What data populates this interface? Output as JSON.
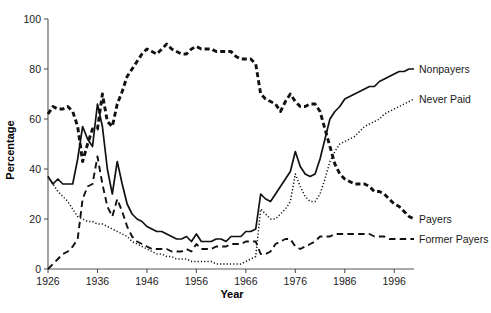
{
  "chart_data": {
    "type": "line",
    "title": "",
    "xlabel": "Year",
    "ylabel": "Percentage",
    "xlim": [
      1926,
      2000
    ],
    "ylim": [
      0,
      100
    ],
    "grid": false,
    "legend_position": "right-inline-labels",
    "xticks": [
      1926,
      1936,
      1946,
      1956,
      1966,
      1976,
      1986,
      1996
    ],
    "xtick_labels": [
      "1926",
      "1936",
      "1946",
      "1956",
      "1966",
      "1976",
      "1986",
      "1996"
    ],
    "yticks": [
      0,
      20,
      40,
      60,
      80,
      100
    ],
    "ytick_labels": [
      "0",
      "20",
      "40",
      "60",
      "80",
      "100"
    ],
    "x": [
      1926,
      1927,
      1928,
      1929,
      1930,
      1931,
      1932,
      1933,
      1934,
      1935,
      1936,
      1937,
      1938,
      1939,
      1940,
      1941,
      1942,
      1943,
      1944,
      1945,
      1946,
      1947,
      1948,
      1949,
      1950,
      1951,
      1952,
      1953,
      1954,
      1955,
      1956,
      1957,
      1958,
      1959,
      1960,
      1961,
      1962,
      1963,
      1964,
      1965,
      1966,
      1967,
      1968,
      1969,
      1970,
      1971,
      1972,
      1973,
      1974,
      1975,
      1976,
      1977,
      1978,
      1979,
      1980,
      1981,
      1982,
      1983,
      1984,
      1985,
      1986,
      1987,
      1988,
      1989,
      1990,
      1991,
      1992,
      1993,
      1994,
      1995,
      1996,
      1997,
      1998,
      1999,
      2000
    ],
    "series": [
      {
        "name": "Nonpayers",
        "style": "solid",
        "label_value_2000": 80,
        "values": [
          37,
          34,
          36,
          34,
          34,
          34,
          44,
          57,
          52,
          49,
          66,
          57,
          40,
          30,
          43,
          34,
          26,
          22,
          20,
          19,
          17,
          16,
          15,
          15,
          14,
          13,
          12,
          12,
          13,
          11,
          14,
          11,
          11,
          11,
          12,
          12,
          11,
          13,
          13,
          13,
          15,
          15,
          16,
          30,
          28,
          27,
          30,
          33,
          36,
          39,
          47,
          41,
          38,
          37,
          38,
          44,
          52,
          60,
          63,
          65,
          68,
          69,
          70,
          71,
          72,
          73,
          73,
          75,
          76,
          77,
          78,
          79,
          79,
          80,
          80
        ]
      },
      {
        "name": "Never Paid",
        "style": "dotted",
        "label_value_2000": 68,
        "values": [
          37,
          34,
          31,
          29,
          27,
          24,
          21,
          20,
          19,
          19,
          18,
          18,
          17,
          16,
          15,
          14,
          13,
          11,
          10,
          9,
          8,
          7,
          6,
          6,
          5,
          5,
          4,
          4,
          4,
          3,
          3,
          3,
          3,
          3,
          2,
          2,
          2,
          2,
          2,
          2,
          3,
          4,
          5,
          24,
          22,
          20,
          20,
          22,
          24,
          27,
          38,
          33,
          29,
          27,
          27,
          30,
          36,
          43,
          47,
          50,
          51,
          52,
          53,
          55,
          57,
          58,
          59,
          60,
          62,
          63,
          64,
          65,
          66,
          67,
          68
        ]
      },
      {
        "name": "Payers",
        "style": "heavy-dashed",
        "label_value_2000": 20,
        "values": [
          62,
          65,
          64,
          64,
          65,
          63,
          57,
          43,
          50,
          56,
          56,
          70,
          59,
          57,
          66,
          71,
          77,
          80,
          83,
          86,
          88,
          87,
          86,
          88,
          90,
          88,
          87,
          86,
          86,
          88,
          89,
          88,
          88,
          88,
          87,
          87,
          87,
          87,
          85,
          84,
          84,
          84,
          82,
          70,
          68,
          67,
          66,
          63,
          67,
          70,
          67,
          65,
          65,
          66,
          66,
          63,
          56,
          49,
          42,
          38,
          36,
          35,
          34,
          34,
          34,
          33,
          31,
          31,
          30,
          28,
          26,
          25,
          23,
          21,
          20
        ]
      },
      {
        "name": "Former Payers",
        "style": "dashed",
        "label_value_2000": 12,
        "values": [
          0,
          2,
          4,
          6,
          7,
          9,
          12,
          28,
          33,
          34,
          45,
          34,
          25,
          21,
          28,
          23,
          17,
          13,
          11,
          10,
          9,
          8,
          8,
          8,
          8,
          7,
          7,
          7,
          8,
          7,
          10,
          8,
          8,
          8,
          9,
          9,
          9,
          10,
          10,
          10,
          11,
          11,
          11,
          6,
          6,
          7,
          10,
          11,
          12,
          12,
          9,
          8,
          9,
          10,
          11,
          13,
          13,
          13,
          14,
          14,
          14,
          14,
          14,
          14,
          14,
          14,
          13,
          13,
          13,
          12,
          12,
          12,
          12,
          12,
          12
        ]
      }
    ],
    "series_labels": [
      {
        "name": "Nonpayers",
        "text": "Nonpayers"
      },
      {
        "name": "Never Paid",
        "text": "Never Paid"
      },
      {
        "name": "Payers",
        "text": "Payers"
      },
      {
        "name": "Former Payers",
        "text": "Former Payers"
      }
    ]
  }
}
